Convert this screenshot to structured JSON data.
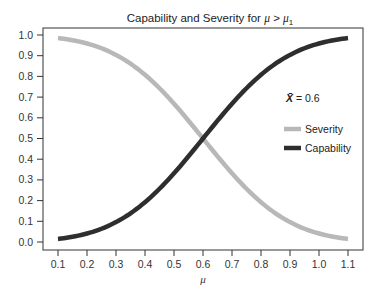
{
  "chart_data": {
    "type": "line",
    "title": "Capability and Severity for μ > μ1",
    "title_parts": {
      "prefix": "Capability and Severity for ",
      "mu": "μ",
      "op": " > ",
      "mu1": "μ",
      "sub": "1"
    },
    "xlabel": "μ",
    "ylabel": "",
    "xlim": [
      0.1,
      1.1
    ],
    "ylim": [
      0.0,
      1.0
    ],
    "x_ticks": [
      "0.1",
      "0.2",
      "0.3",
      "0.4",
      "0.5",
      "0.6",
      "0.7",
      "0.8",
      "0.9",
      "1.0",
      "1.1"
    ],
    "y_ticks": [
      "0.0",
      "0.1",
      "0.2",
      "0.3",
      "0.4",
      "0.5",
      "0.6",
      "0.7",
      "0.8",
      "0.9",
      "1.0"
    ],
    "grid": false,
    "legend_position": "right, middle (inside plot)",
    "annotation": {
      "symbol": "X̄",
      "text": " = 0.6"
    },
    "x": [
      0.1,
      0.2,
      0.3,
      0.4,
      0.5,
      0.6,
      0.7,
      0.8,
      0.9,
      1.0,
      1.1
    ],
    "series": [
      {
        "name": "Severity",
        "color": "#b8b8b8",
        "values": [
          0.985,
          0.959,
          0.903,
          0.807,
          0.668,
          0.5,
          0.332,
          0.193,
          0.097,
          0.041,
          0.015
        ]
      },
      {
        "name": "Capability",
        "color": "#2e2e2e",
        "values": [
          0.015,
          0.041,
          0.097,
          0.193,
          0.332,
          0.5,
          0.668,
          0.807,
          0.903,
          0.959,
          0.985
        ]
      }
    ],
    "curve_model": {
      "kind": "normal_cdf",
      "center": 0.6,
      "sd": 0.23
    }
  }
}
